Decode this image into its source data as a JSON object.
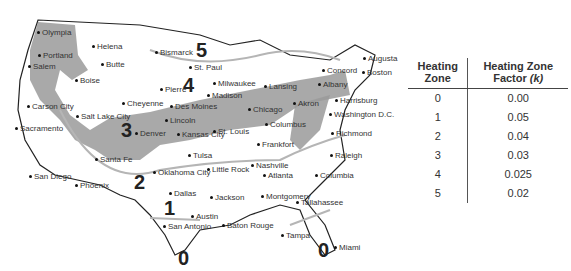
{
  "map": {
    "title": "US Heating Zones",
    "zones": [
      {
        "label": "5",
        "x": 196,
        "y": 40
      },
      {
        "label": "4",
        "x": 183,
        "y": 75
      },
      {
        "label": "3",
        "x": 121,
        "y": 120
      },
      {
        "label": "2",
        "x": 134,
        "y": 172
      },
      {
        "label": "1",
        "x": 164,
        "y": 198
      },
      {
        "label": "0",
        "x": 178,
        "y": 248
      },
      {
        "label": "0",
        "x": 318,
        "y": 240
      }
    ],
    "cities": [
      {
        "name": "Olympia",
        "x": 42,
        "y": 29
      },
      {
        "name": "Portland",
        "x": 43,
        "y": 52
      },
      {
        "name": "Salem",
        "x": 33,
        "y": 63
      },
      {
        "name": "Helena",
        "x": 97,
        "y": 43
      },
      {
        "name": "Butte",
        "x": 106,
        "y": 61
      },
      {
        "name": "Boise",
        "x": 80,
        "y": 77
      },
      {
        "name": "Bismarck",
        "x": 160,
        "y": 49
      },
      {
        "name": "St. Paul",
        "x": 194,
        "y": 64
      },
      {
        "name": "Pierre",
        "x": 165,
        "y": 86
      },
      {
        "name": "Milwaukee",
        "x": 218,
        "y": 80
      },
      {
        "name": "Madison",
        "x": 212,
        "y": 92
      },
      {
        "name": "Lansing",
        "x": 269,
        "y": 83
      },
      {
        "name": "Concord",
        "x": 327,
        "y": 67
      },
      {
        "name": "Augusta",
        "x": 368,
        "y": 55
      },
      {
        "name": "Boston",
        "x": 367,
        "y": 69
      },
      {
        "name": "Albany",
        "x": 323,
        "y": 81
      },
      {
        "name": "Cheyenne",
        "x": 127,
        "y": 100
      },
      {
        "name": "Des Moines",
        "x": 175,
        "y": 103
      },
      {
        "name": "Chicago",
        "x": 253,
        "y": 106
      },
      {
        "name": "Akron",
        "x": 298,
        "y": 100
      },
      {
        "name": "Harrisburg",
        "x": 340,
        "y": 97
      },
      {
        "name": "Carson City",
        "x": 32,
        "y": 103
      },
      {
        "name": "Salt Lake City",
        "x": 81,
        "y": 113
      },
      {
        "name": "Lincoln",
        "x": 170,
        "y": 117
      },
      {
        "name": "Columbus",
        "x": 270,
        "y": 121
      },
      {
        "name": "Washington D.C.",
        "x": 334,
        "y": 111
      },
      {
        "name": "Sacramento",
        "x": 20,
        "y": 125
      },
      {
        "name": "Denver",
        "x": 140,
        "y": 130
      },
      {
        "name": "Kansas City",
        "x": 182,
        "y": 131
      },
      {
        "name": "St. Louis",
        "x": 218,
        "y": 128
      },
      {
        "name": "Richmond",
        "x": 336,
        "y": 130
      },
      {
        "name": "Frankfort",
        "x": 262,
        "y": 141
      },
      {
        "name": "Santa Fe",
        "x": 100,
        "y": 156
      },
      {
        "name": "Tulsa",
        "x": 193,
        "y": 152
      },
      {
        "name": "Nashville",
        "x": 256,
        "y": 162
      },
      {
        "name": "Little Rock",
        "x": 212,
        "y": 166
      },
      {
        "name": "Raleigh",
        "x": 335,
        "y": 152
      },
      {
        "name": "Oklahoma City",
        "x": 158,
        "y": 169
      },
      {
        "name": "Atlanta",
        "x": 268,
        "y": 172
      },
      {
        "name": "Columbia",
        "x": 320,
        "y": 172
      },
      {
        "name": "San Diego",
        "x": 34,
        "y": 173
      },
      {
        "name": "Phoenix",
        "x": 80,
        "y": 182
      },
      {
        "name": "Dallas",
        "x": 174,
        "y": 190
      },
      {
        "name": "Jackson",
        "x": 215,
        "y": 194
      },
      {
        "name": "Montgomery",
        "x": 266,
        "y": 193
      },
      {
        "name": "Tallahassee",
        "x": 301,
        "y": 199
      },
      {
        "name": "Austin",
        "x": 196,
        "y": 213
      },
      {
        "name": "San Antonio",
        "x": 168,
        "y": 223
      },
      {
        "name": "Baton Rouge",
        "x": 227,
        "y": 222
      },
      {
        "name": "Tampa",
        "x": 286,
        "y": 232
      },
      {
        "name": "Miami",
        "x": 339,
        "y": 244
      }
    ]
  },
  "table": {
    "headers": [
      "Heating Zone",
      "Heating Zone Factor (k)"
    ],
    "header_col1_lines": [
      "Heating",
      "Zone"
    ],
    "header_col2_lines": [
      "Heating Zone",
      "Factor"
    ],
    "header_col2_italic": "(k)",
    "rows": [
      {
        "zone": "0",
        "factor": "0.00"
      },
      {
        "zone": "1",
        "factor": "0.05"
      },
      {
        "zone": "2",
        "factor": "0.04"
      },
      {
        "zone": "3",
        "factor": "0.03"
      },
      {
        "zone": "4",
        "factor": "0.025"
      },
      {
        "zone": "5",
        "factor": "0.02"
      }
    ]
  },
  "colors": {
    "shade": "#9a9a9a",
    "line": "#b5b5b5",
    "border": "#222222"
  }
}
